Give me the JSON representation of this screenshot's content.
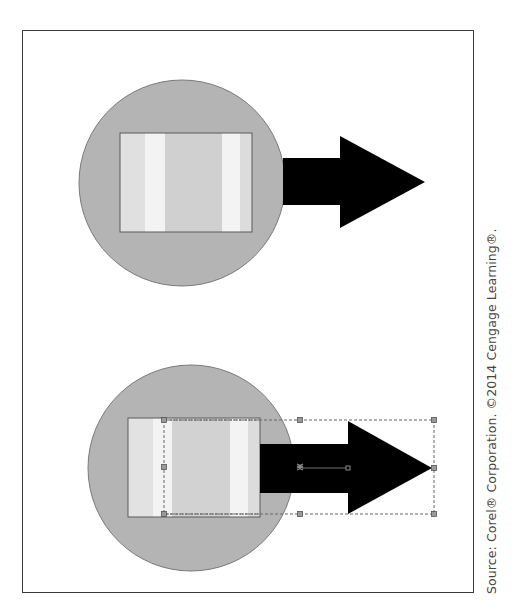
{
  "figure": {
    "credit": "Source: Corel® Corporation. ©2014 Cengage Learning®.",
    "panels": [
      {
        "name": "before",
        "description": "Gray circle with striped rectangle and black arrow, no selection",
        "selected": false
      },
      {
        "name": "after",
        "description": "Gray circle with striped rectangle and black arrow, arrow and part of rectangle selected with dashed bounding box and handles",
        "selected": true,
        "selection_handles": 8
      }
    ]
  },
  "colors": {
    "frame_border": "#3a3a3a",
    "circle_fill": "#b4b4b4",
    "circle_stroke": "#7a7a7a",
    "rect_stroke": "#5a5a5a",
    "stripe_light": "#e0e0e0",
    "stripe_white": "#f3f3f3",
    "stripe_mid": "#d0d0d0",
    "arrow_fill": "#000000",
    "selection_stroke": "#666666",
    "credit_text": "#444444"
  }
}
